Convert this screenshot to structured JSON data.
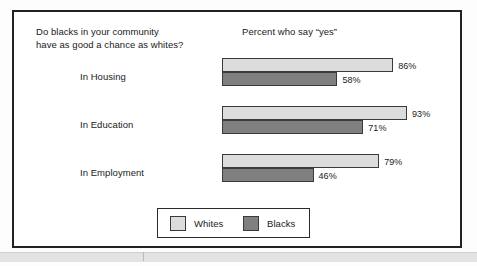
{
  "chart_data": {
    "type": "bar",
    "orientation": "horizontal",
    "title": "Do blacks in your community\nhave as good a chance as whites?",
    "header": "Percent who say “yes”",
    "xlabel": "",
    "ylabel": "",
    "xlim": [
      0,
      100
    ],
    "grid": false,
    "value_suffix": "%",
    "legend_position": "bottom-center",
    "categories": [
      "In Housing",
      "In Education",
      "In Employment"
    ],
    "series": [
      {
        "name": "Whites",
        "color": "#dcdcdc",
        "values": [
          86,
          93,
          79
        ],
        "labels": [
          "86%",
          "93%",
          "79%"
        ]
      },
      {
        "name": "Blacks",
        "color": "#808080",
        "values": [
          58,
          71,
          46
        ],
        "labels": [
          "58%",
          "71%",
          "46%"
        ]
      }
    ]
  },
  "legend": {
    "items": [
      {
        "label": "Whites",
        "color": "#dcdcdc"
      },
      {
        "label": "Blacks",
        "color": "#808080"
      }
    ]
  },
  "style": {
    "frame_color": "#222222",
    "text_color": "#1a1a1a",
    "background": "#ffffff"
  }
}
